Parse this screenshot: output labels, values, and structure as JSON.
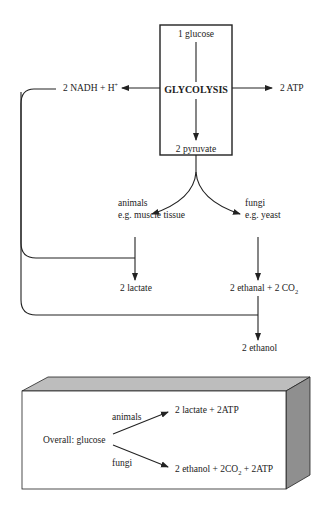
{
  "glycolysis_box": {
    "input": "1 glucose",
    "process": "GLYCOLYSIS",
    "output": "2 pyruvate"
  },
  "side_products": {
    "nadh": "2 NADH + H",
    "nadh_sup": "+",
    "atp": "2 ATP"
  },
  "branches": {
    "animals": {
      "label": "animals",
      "example": "e.g. muscle tissue",
      "product": "2 lactate"
    },
    "fungi": {
      "label": "fungi",
      "example": "e.g. yeast",
      "product_main": "2 ethanal + 2 CO",
      "product_sub": "2",
      "final": "2 ethanol"
    }
  },
  "summary_box": {
    "overall": "Overall:  glucose",
    "animals_label": "animals",
    "animals_result": "2 lactate + 2ATP",
    "fungi_label": "fungi",
    "fungi_result_a": "2 ethanol + 2CO",
    "fungi_result_sub": "2",
    "fungi_result_b": " + 2ATP"
  },
  "colors": {
    "line": "#222222",
    "box_top": "#bdbdbd",
    "box_side": "#8f8f8f",
    "box_front": "#ffffff"
  }
}
